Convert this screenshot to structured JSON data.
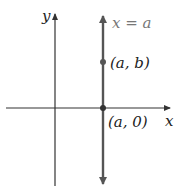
{
  "diagram": {
    "axes": {
      "x_label": "x",
      "y_label": "y"
    },
    "vertical_line": {
      "label": "x = a",
      "color": "#555555"
    },
    "points": [
      {
        "label": "(a, b)"
      },
      {
        "label": "(a, 0)"
      }
    ],
    "axis_color": "#333333",
    "point_color": "#555555"
  }
}
